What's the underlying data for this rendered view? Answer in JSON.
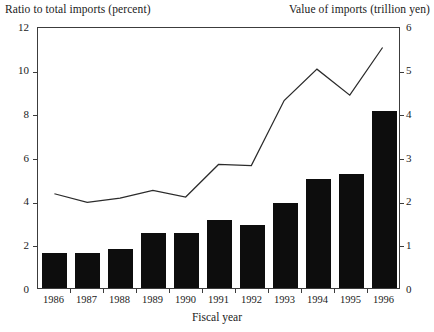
{
  "titles": {
    "left_axis": "Ratio to total imports (percent)",
    "right_axis": "Value of imports (trillion yen)",
    "x_axis": "Fiscal year"
  },
  "chart_data": {
    "type": "bar",
    "title": "",
    "xlabel": "Fiscal year",
    "ylabel": "Ratio to total imports (percent)",
    "y2label": "Value of imports (trillion yen)",
    "categories": [
      "1986",
      "1987",
      "1988",
      "1989",
      "1990",
      "1991",
      "1992",
      "1993",
      "1994",
      "1995",
      "1996"
    ],
    "ylim": [
      0,
      12
    ],
    "yticks": [
      0,
      2,
      4,
      6,
      8,
      10,
      12
    ],
    "y2lim": [
      0,
      6
    ],
    "y2ticks": [
      0,
      1,
      2,
      3,
      4,
      5,
      6
    ],
    "grid": false,
    "legend": "none",
    "series": [
      {
        "name": "Value of imports (trillion yen)",
        "type": "bar",
        "axis": "right",
        "values": [
          0.8,
          0.8,
          0.9,
          1.25,
          1.25,
          1.55,
          1.45,
          1.95,
          2.5,
          2.6,
          4.05
        ]
      },
      {
        "name": "Ratio to total imports (percent)",
        "type": "line",
        "axis": "left",
        "values": [
          4.35,
          3.95,
          4.15,
          4.5,
          4.2,
          5.7,
          5.65,
          8.65,
          10.1,
          8.9,
          11.1
        ]
      }
    ]
  }
}
